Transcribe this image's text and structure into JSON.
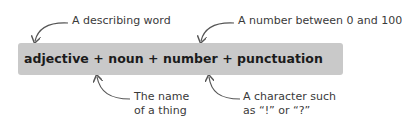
{
  "formula": {
    "text": "adjective + noun + number + punctuation",
    "parts": [
      "adjective",
      "noun",
      "number",
      "punctuation"
    ]
  },
  "annotations": {
    "adjective": {
      "label": "A describing word"
    },
    "number": {
      "label": "A number between 0 and 100"
    },
    "noun": {
      "line1": "The name",
      "line2": "of a thing"
    },
    "punctuation": {
      "line1": "A character such",
      "line2": "as “!” or “?”"
    }
  },
  "colors": {
    "box": "#c9c9c9",
    "text": "#1b1b1b",
    "arrow": "#555555"
  }
}
